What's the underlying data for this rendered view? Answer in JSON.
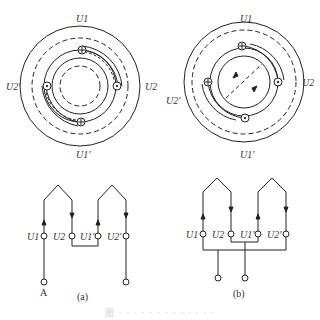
{
  "figure": {
    "diagram_a": {
      "labels": {
        "top": "U1",
        "right": "U2",
        "left": "U2'",
        "bottom": "U1'"
      },
      "terminals": [
        "U1",
        "U2",
        "U1'",
        "U2'"
      ],
      "input_label": "A",
      "sublabel": "(a)"
    },
    "diagram_b": {
      "labels": {
        "top": "U1",
        "right": "U2",
        "left": "U2'",
        "bottom": "U1'"
      },
      "terminals": [
        "U1",
        "U2",
        "U1'",
        "U2'"
      ],
      "sublabel": "(b)"
    },
    "caption": "图 · · · · · · · · · · · · ·"
  }
}
